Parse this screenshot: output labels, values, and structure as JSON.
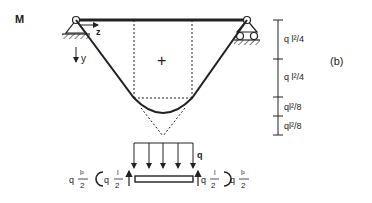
{
  "diagram": {
    "title": "M",
    "panel_label": "(b)",
    "axis_z": "z",
    "axis_y": "y",
    "region_sign": "+",
    "dimensions": [
      {
        "label_base": "q",
        "label_exp": "l²/4"
      },
      {
        "label_base": "q",
        "label_exp": "l²/4"
      },
      {
        "label_base": "q",
        "label_exp": "l²/8"
      },
      {
        "label_base": "q",
        "label_exp": "l²/8"
      }
    ],
    "load_label": "q",
    "free_body": {
      "left_moment": {
        "coef": "q",
        "num": "l²",
        "den": "2"
      },
      "left_shear": {
        "coef": "q",
        "num": "l",
        "den": "2"
      },
      "right_shear": {
        "coef": "q",
        "num": "l",
        "den": "2"
      },
      "right_moment": {
        "coef": "q",
        "num": "l²",
        "den": "2"
      }
    },
    "colors": {
      "ink": "#222222",
      "background": "#ffffff"
    }
  }
}
